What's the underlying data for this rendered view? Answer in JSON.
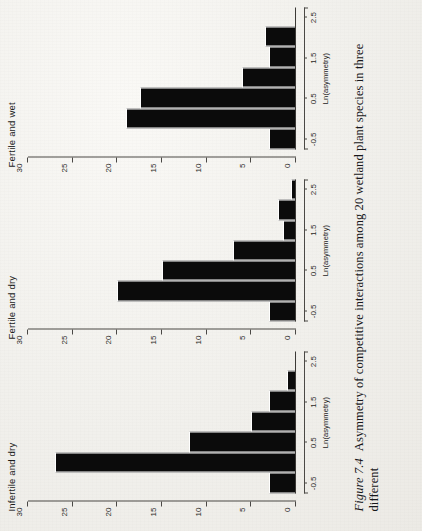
{
  "figure": {
    "number_label": "Figure 7.4",
    "caption_text": "Asymmetry of competitive interactions among 20 wetland plant species in three different",
    "y_axis_title": "Frequency",
    "x_axis_title": "Ln(asymmetry)"
  },
  "chart_data": {
    "type": "bar",
    "title": "Asymmetry of competitive interactions among 20 wetland plant species in three different",
    "xlabel": "Ln(asymmetry)",
    "ylabel": "Frequency",
    "ylim": [
      0,
      30
    ],
    "yticks": [
      0,
      5,
      10,
      15,
      20,
      25,
      30
    ],
    "xlim": [
      -0.75,
      2.75
    ],
    "xticks": [
      -0.5,
      0.5,
      1.5,
      2.5
    ],
    "grid": false,
    "legend": "none",
    "bin_width": 0.5,
    "bin_centers": [
      -0.25,
      0.25,
      0.75,
      1.25,
      1.75,
      2.25,
      2.75
    ],
    "panels": [
      {
        "name": "Infertile and dry",
        "values": [
          3,
          27,
          12,
          5,
          3,
          1,
          0
        ]
      },
      {
        "name": "Fertile and dry",
        "values": [
          3,
          20,
          15,
          7,
          1.5,
          2,
          0.6
        ]
      },
      {
        "name": "Fertile and wet",
        "values": [
          3,
          19,
          17.5,
          6,
          3,
          3.5,
          0
        ]
      }
    ]
  },
  "panels": [
    {
      "title": "Infertile and dry"
    },
    {
      "title": "Fertile and dry"
    },
    {
      "title": "Fertile and wet"
    }
  ],
  "y_tick_labels": [
    "0",
    "5",
    "10",
    "15",
    "20",
    "25",
    "30"
  ],
  "x_tick_labels": [
    "-0.5",
    "0.5",
    "1.5",
    "2.5"
  ]
}
